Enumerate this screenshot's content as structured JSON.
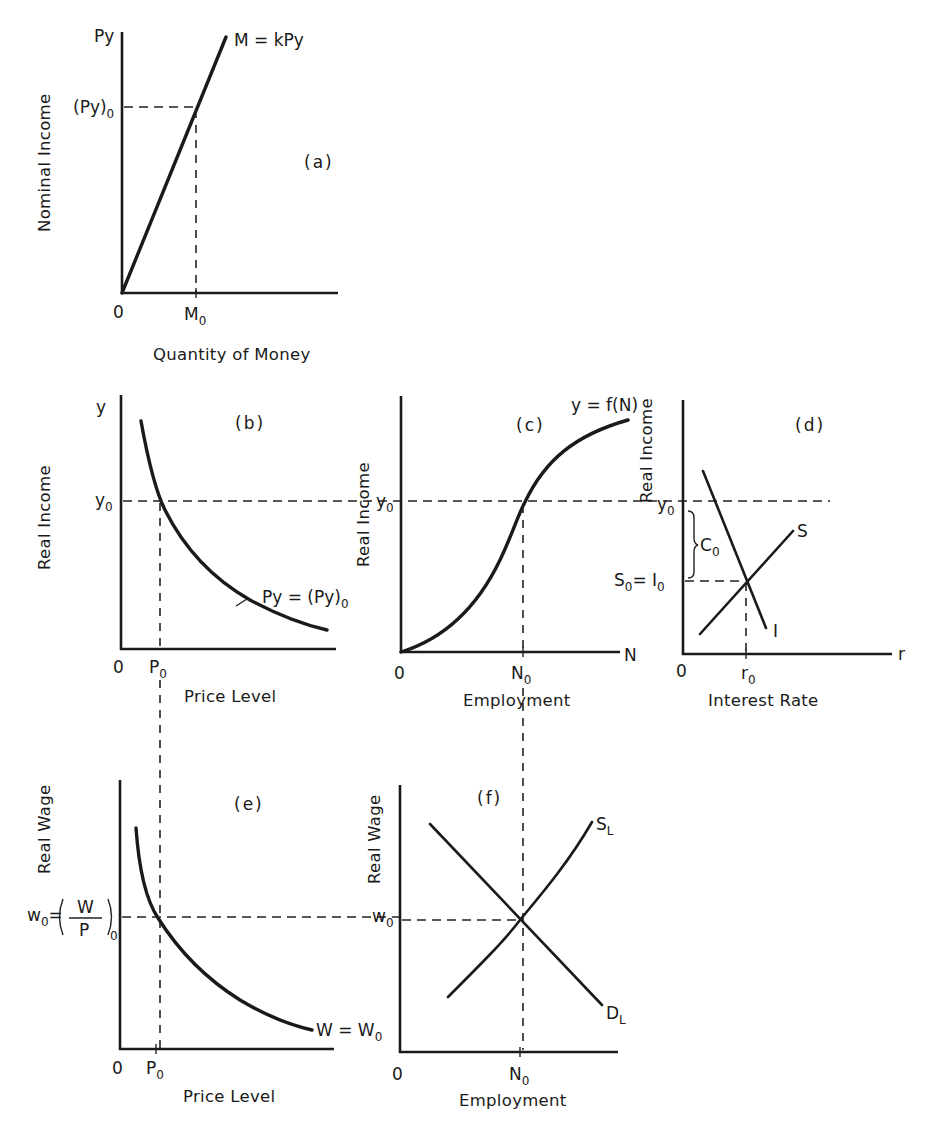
{
  "figure": {
    "panels": {
      "a": {
        "tag": "(a)",
        "y_axis_top": "Py",
        "y_axis_title": "Nominal Income",
        "x_axis_title": "Quantity of Money",
        "origin": "0",
        "y_mark": "(Py)",
        "y_mark_sub": "0",
        "x_mark": "M",
        "x_mark_sub": "0",
        "curve_label": "M = kPy"
      },
      "b": {
        "tag": "(b)",
        "y_axis_top": "y",
        "y_axis_title": "Real Income",
        "x_axis_title": "Price Level",
        "origin": "0",
        "y_mark": "y",
        "y_mark_sub": "0",
        "x_mark": "P",
        "x_mark_sub": "0",
        "curve_label": "Py = (Py)",
        "curve_label_sub": "0"
      },
      "c": {
        "tag": "(c)",
        "y_axis_title": "Real Income",
        "x_axis_title": "Employment",
        "x_axis_end": "N",
        "origin": "0",
        "y_mark": "y",
        "y_mark_sub": "0",
        "x_mark": "N",
        "x_mark_sub": "0",
        "curve_label": "y = f(N)"
      },
      "d": {
        "tag": "(d)",
        "y_axis_title": "Real Income",
        "x_axis_title": "Interest Rate",
        "x_axis_end": "r",
        "origin": "0",
        "y_mark": "y",
        "y_mark_sub": "0",
        "y_mark2": "S",
        "y_mark2_sub": "0",
        "y_mark2_eq": "= I",
        "y_mark2_eq_sub": "0",
        "brace_label": "C",
        "brace_label_sub": "0",
        "x_mark": "r",
        "x_mark_sub": "0",
        "savings_label": "S",
        "investment_label": "I"
      },
      "e": {
        "tag": "(e)",
        "y_axis_title": "Real Wage",
        "x_axis_title": "Price Level",
        "origin": "0",
        "y_mark_w": "w",
        "y_mark_w_sub": "0",
        "y_mark_eq": "=",
        "y_mark_frac_num": "W",
        "y_mark_frac_den": "P",
        "y_mark_frac_sub": "0",
        "x_mark": "P",
        "x_mark_sub": "0",
        "curve_label": "W = W",
        "curve_label_sub": "0"
      },
      "f": {
        "tag": "(f)",
        "y_axis_title": "Real Wage",
        "x_axis_title": "Employment",
        "origin": "0",
        "y_mark": "w",
        "y_mark_sub": "0",
        "x_mark": "N",
        "x_mark_sub": "0",
        "supply_label": "S",
        "supply_label_sub": "L",
        "demand_label": "D",
        "demand_label_sub": "L"
      }
    }
  }
}
